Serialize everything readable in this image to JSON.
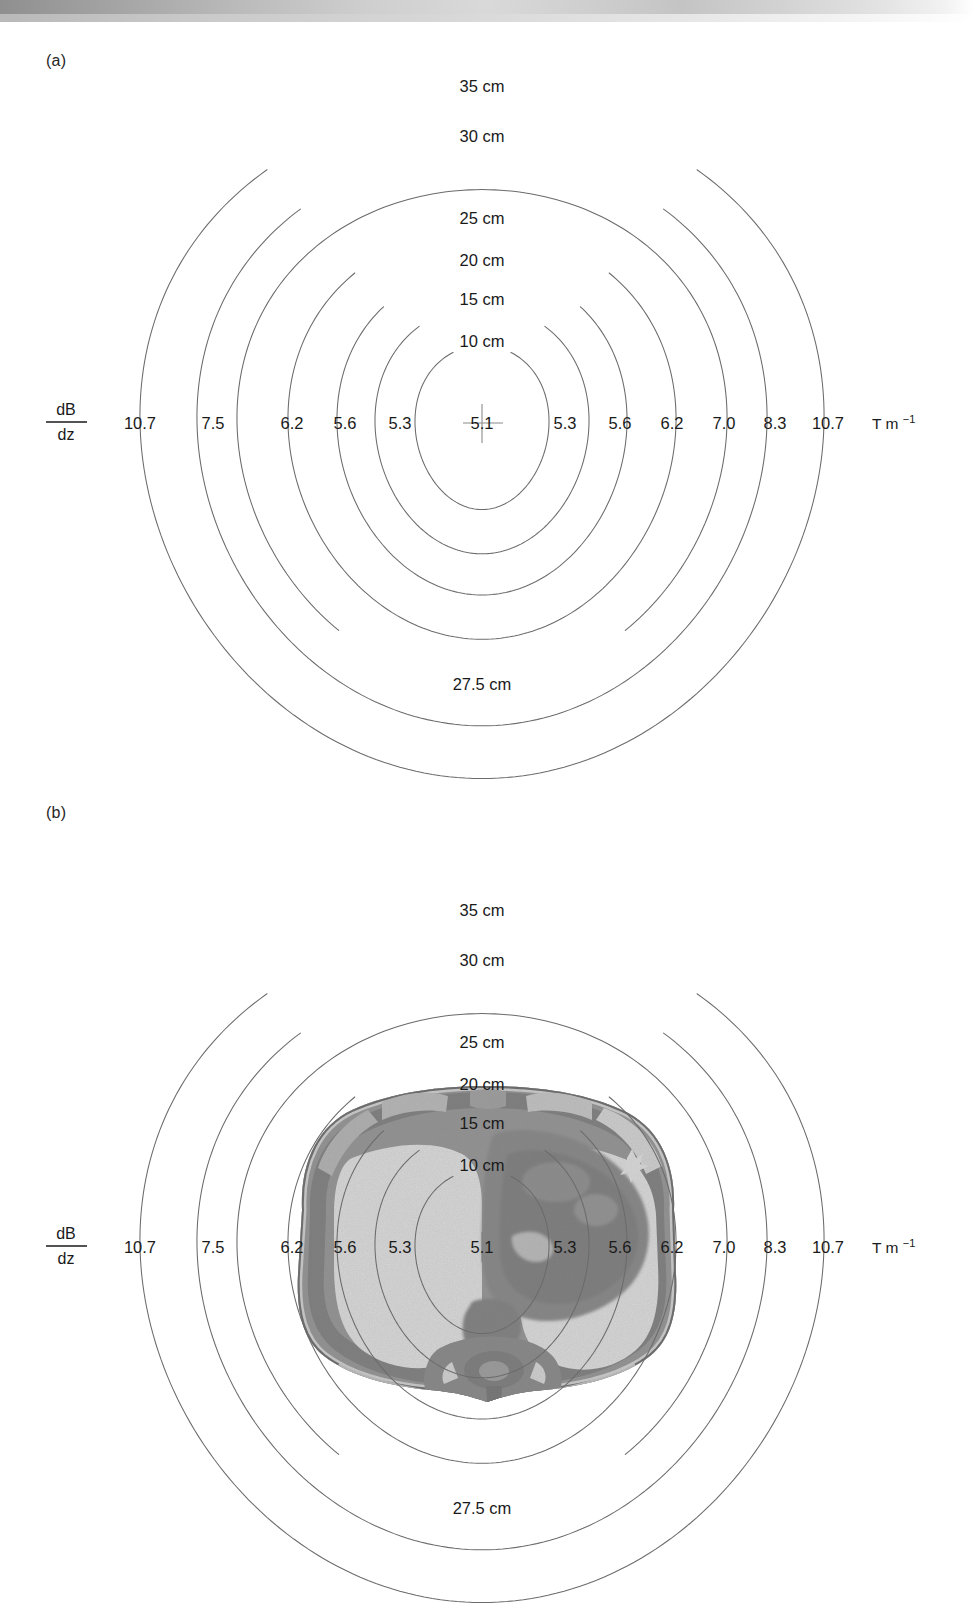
{
  "figure": {
    "scan_bar": "page-edge-scan-artifact",
    "panels": [
      {
        "tag": "(a)",
        "name": "gradient-field-contours-empty",
        "has_anatomy": false,
        "anatomy_caption": ""
      },
      {
        "tag": "(b)",
        "name": "gradient-field-contours-with-thorax",
        "has_anatomy": true,
        "anatomy_caption": "axial-thorax-ct-slice"
      }
    ]
  },
  "axis": {
    "y_label_numerator": "dB",
    "y_label_denominator": "dz",
    "unit": "T m",
    "unit_exponent": "−1",
    "unit_full": "T m⁻¹",
    "center_value": "5.1",
    "left_values": [
      "10.7",
      "7.5",
      "6.2",
      "5.6",
      "5.3"
    ],
    "right_values": [
      "5.3",
      "5.6",
      "6.2",
      "7.0",
      "8.3",
      "10.7"
    ]
  },
  "rings": {
    "top_labels": [
      "35 cm",
      "30 cm",
      "25 cm",
      "20 cm",
      "15 cm",
      "10 cm"
    ],
    "bottom_label": "27.5 cm"
  },
  "chart_data": {
    "type": "line",
    "subtitle": "Nested ovoid iso-gradient contours labelled by distance from isocentre and gradient magnitude",
    "xlabel": "dB/dz (T m⁻¹)",
    "ylabel": "Distance from isocentre (cm)",
    "grid": false,
    "legend_position": "none",
    "annotations": [
      "(a) contour map only",
      "(b) contour map overlaid on axial thorax CT slice",
      "27.5 cm",
      "T m⁻¹"
    ],
    "contours": [
      {
        "radius_cm": 10,
        "label": "10 cm",
        "gradient_left": "5.3",
        "gradient_right": "5.3",
        "rx_px": 67,
        "ry_px": 82
      },
      {
        "radius_cm": 15,
        "label": "15 cm",
        "gradient_left": "5.6",
        "gradient_right": "5.6",
        "rx_px": 107,
        "ry_px": 124
      },
      {
        "radius_cm": 20,
        "label": "20 cm",
        "gradient_left": "6.2",
        "gradient_right": "6.2",
        "rx_px": 145,
        "ry_px": 163
      },
      {
        "radius_cm": 25,
        "label": "25 cm",
        "gradient_left": "7.5",
        "gradient_right": "7.0",
        "rx_px": 194,
        "ry_px": 205
      },
      {
        "radius_cm": 27.5,
        "label": "27.5 cm",
        "gradient_left": "",
        "gradient_right": "8.3",
        "rx_px": 245,
        "ry_px": 247
      },
      {
        "radius_cm": 30,
        "label": "30 cm",
        "gradient_left": "",
        "gradient_right": "",
        "rx_px": 285,
        "ry_px": 287
      },
      {
        "radius_cm": 35,
        "label": "35 cm",
        "gradient_left": "10.7",
        "gradient_right": "10.7",
        "rx_px": 342,
        "ry_px": 337
      }
    ],
    "x_tick_labels_left": [
      "10.7",
      "7.5",
      "6.2",
      "5.6",
      "5.3"
    ],
    "x_tick_labels_right": [
      "5.3",
      "5.6",
      "6.2",
      "7.0",
      "8.3",
      "10.7"
    ],
    "x_tick_center": "5.1",
    "series": [
      {
        "name": "dB/dz along horizontal midline (left to right)",
        "x_cm": [
          -35,
          -25,
          -20,
          -15,
          -10,
          0,
          10,
          15,
          20,
          25,
          27.5,
          35
        ],
        "values": [
          10.7,
          7.5,
          6.2,
          5.6,
          5.3,
          5.1,
          5.3,
          5.6,
          6.2,
          7.0,
          8.3,
          10.7
        ]
      }
    ]
  }
}
